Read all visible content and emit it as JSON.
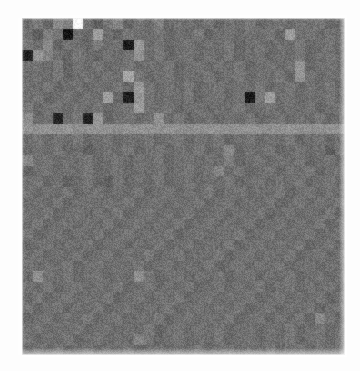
{
  "figure": {
    "background_color": "#fdfdfd",
    "caption": ""
  },
  "plot": {
    "left_px": 22,
    "top_px": 18,
    "width_px": 323,
    "height_px": 337,
    "border_color": "#e6e6e6",
    "base_color": "#6a6a6a"
  },
  "chart_data": {
    "type": "heatmap",
    "title": "",
    "subtitle": "",
    "xlabel": "",
    "ylabel": "",
    "xticklabels": [],
    "yticklabels": [],
    "legend": [],
    "grid": false,
    "colormap": "gray",
    "vmin": 0,
    "vmax": 1,
    "noise_amplitude": 0.085,
    "rows": 32,
    "cols": 32,
    "annotations": [
      {
        "label": "blank-cell",
        "row": 0,
        "col": 5,
        "value": 1.0
      },
      {
        "label": "bright-band",
        "row": 10,
        "value": 0.58
      }
    ],
    "values": [
      [
        0.42,
        0.48,
        0.4,
        0.55,
        0.5,
        1.0,
        0.44,
        0.38,
        0.46,
        0.52,
        0.4,
        0.47,
        0.43,
        0.5,
        0.41,
        0.45,
        0.44,
        0.42,
        0.47,
        0.4,
        0.45,
        0.43,
        0.48,
        0.41,
        0.44,
        0.46,
        0.42,
        0.45,
        0.43,
        0.47,
        0.41,
        0.44
      ],
      [
        0.45,
        0.38,
        0.5,
        0.47,
        0.09,
        0.44,
        0.41,
        0.62,
        0.43,
        0.4,
        0.47,
        0.44,
        0.42,
        0.46,
        0.41,
        0.45,
        0.43,
        0.48,
        0.4,
        0.44,
        0.46,
        0.42,
        0.45,
        0.43,
        0.47,
        0.41,
        0.62,
        0.44,
        0.46,
        0.42,
        0.45,
        0.43
      ],
      [
        0.47,
        0.43,
        0.55,
        0.4,
        0.46,
        0.44,
        0.41,
        0.48,
        0.42,
        0.45,
        0.11,
        0.6,
        0.43,
        0.47,
        0.41,
        0.44,
        0.46,
        0.42,
        0.45,
        0.43,
        0.47,
        0.41,
        0.44,
        0.46,
        0.42,
        0.45,
        0.43,
        0.47,
        0.41,
        0.44,
        0.46,
        0.42
      ],
      [
        0.13,
        0.58,
        0.52,
        0.44,
        0.41,
        0.47,
        0.43,
        0.4,
        0.46,
        0.42,
        0.45,
        0.57,
        0.43,
        0.47,
        0.41,
        0.44,
        0.46,
        0.42,
        0.45,
        0.43,
        0.47,
        0.41,
        0.44,
        0.46,
        0.42,
        0.45,
        0.43,
        0.47,
        0.41,
        0.44,
        0.46,
        0.42
      ],
      [
        0.44,
        0.46,
        0.42,
        0.48,
        0.4,
        0.45,
        0.43,
        0.47,
        0.41,
        0.44,
        0.46,
        0.42,
        0.45,
        0.43,
        0.47,
        0.41,
        0.44,
        0.46,
        0.42,
        0.45,
        0.43,
        0.47,
        0.41,
        0.44,
        0.46,
        0.42,
        0.45,
        0.58,
        0.41,
        0.44,
        0.46,
        0.42
      ],
      [
        0.42,
        0.45,
        0.43,
        0.47,
        0.41,
        0.44,
        0.46,
        0.42,
        0.45,
        0.43,
        0.65,
        0.47,
        0.41,
        0.44,
        0.46,
        0.42,
        0.45,
        0.43,
        0.47,
        0.41,
        0.44,
        0.46,
        0.42,
        0.45,
        0.43,
        0.47,
        0.41,
        0.58,
        0.46,
        0.42,
        0.45,
        0.43
      ],
      [
        0.45,
        0.43,
        0.47,
        0.41,
        0.44,
        0.46,
        0.42,
        0.45,
        0.43,
        0.47,
        0.41,
        0.6,
        0.46,
        0.42,
        0.45,
        0.43,
        0.47,
        0.41,
        0.44,
        0.46,
        0.42,
        0.45,
        0.43,
        0.47,
        0.41,
        0.44,
        0.46,
        0.42,
        0.45,
        0.43,
        0.47,
        0.41
      ],
      [
        0.43,
        0.47,
        0.41,
        0.44,
        0.46,
        0.42,
        0.45,
        0.43,
        0.62,
        0.41,
        0.12,
        0.58,
        0.46,
        0.42,
        0.45,
        0.43,
        0.47,
        0.41,
        0.44,
        0.46,
        0.42,
        0.45,
        0.1,
        0.47,
        0.62,
        0.44,
        0.46,
        0.42,
        0.45,
        0.43,
        0.47,
        0.41
      ],
      [
        0.47,
        0.41,
        0.44,
        0.46,
        0.42,
        0.45,
        0.43,
        0.47,
        0.41,
        0.44,
        0.46,
        0.62,
        0.45,
        0.43,
        0.47,
        0.41,
        0.44,
        0.46,
        0.42,
        0.45,
        0.43,
        0.47,
        0.41,
        0.44,
        0.46,
        0.42,
        0.45,
        0.43,
        0.47,
        0.41,
        0.44,
        0.46
      ],
      [
        0.55,
        0.42,
        0.45,
        0.14,
        0.43,
        0.47,
        0.13,
        0.58,
        0.41,
        0.44,
        0.46,
        0.42,
        0.45,
        0.58,
        0.43,
        0.47,
        0.41,
        0.44,
        0.46,
        0.42,
        0.45,
        0.43,
        0.47,
        0.41,
        0.44,
        0.46,
        0.42,
        0.45,
        0.43,
        0.47,
        0.41,
        0.44
      ],
      [
        0.58,
        0.57,
        0.58,
        0.57,
        0.58,
        0.56,
        0.57,
        0.58,
        0.57,
        0.56,
        0.57,
        0.58,
        0.57,
        0.56,
        0.58,
        0.57,
        0.56,
        0.57,
        0.58,
        0.57,
        0.56,
        0.57,
        0.58,
        0.57,
        0.56,
        0.57,
        0.58,
        0.57,
        0.56,
        0.57,
        0.58,
        0.57
      ],
      [
        0.44,
        0.46,
        0.42,
        0.45,
        0.43,
        0.47,
        0.41,
        0.44,
        0.46,
        0.42,
        0.45,
        0.43,
        0.47,
        0.41,
        0.44,
        0.46,
        0.42,
        0.45,
        0.43,
        0.47,
        0.41,
        0.44,
        0.46,
        0.42,
        0.45,
        0.43,
        0.47,
        0.41,
        0.44,
        0.46,
        0.42,
        0.45
      ],
      [
        0.42,
        0.45,
        0.43,
        0.47,
        0.41,
        0.44,
        0.38,
        0.42,
        0.45,
        0.43,
        0.47,
        0.41,
        0.44,
        0.46,
        0.42,
        0.45,
        0.43,
        0.47,
        0.41,
        0.44,
        0.53,
        0.42,
        0.45,
        0.43,
        0.47,
        0.41,
        0.44,
        0.46,
        0.42,
        0.45,
        0.38,
        0.47
      ],
      [
        0.53,
        0.44,
        0.46,
        0.42,
        0.45,
        0.43,
        0.47,
        0.41,
        0.44,
        0.46,
        0.42,
        0.45,
        0.43,
        0.47,
        0.41,
        0.44,
        0.46,
        0.42,
        0.45,
        0.43,
        0.5,
        0.41,
        0.44,
        0.46,
        0.42,
        0.45,
        0.43,
        0.47,
        0.41,
        0.44,
        0.46,
        0.42
      ],
      [
        0.4,
        0.44,
        0.46,
        0.42,
        0.45,
        0.43,
        0.47,
        0.41,
        0.44,
        0.46,
        0.42,
        0.45,
        0.43,
        0.47,
        0.41,
        0.44,
        0.46,
        0.42,
        0.45,
        0.52,
        0.43,
        0.47,
        0.41,
        0.44,
        0.46,
        0.42,
        0.45,
        0.43,
        0.47,
        0.41,
        0.44,
        0.46
      ],
      [
        0.44,
        0.46,
        0.42,
        0.45,
        0.38,
        0.43,
        0.47,
        0.41,
        0.38,
        0.46,
        0.42,
        0.45,
        0.43,
        0.47,
        0.41,
        0.44,
        0.46,
        0.42,
        0.45,
        0.43,
        0.47,
        0.41,
        0.44,
        0.46,
        0.42,
        0.45,
        0.43,
        0.47,
        0.41,
        0.44,
        0.46,
        0.42
      ],
      [
        0.46,
        0.42,
        0.45,
        0.43,
        0.47,
        0.41,
        0.44,
        0.46,
        0.42,
        0.45,
        0.43,
        0.47,
        0.41,
        0.44,
        0.46,
        0.42,
        0.45,
        0.43,
        0.47,
        0.41,
        0.44,
        0.46,
        0.42,
        0.45,
        0.43,
        0.47,
        0.41,
        0.44,
        0.46,
        0.42,
        0.45,
        0.43
      ],
      [
        0.42,
        0.45,
        0.43,
        0.47,
        0.41,
        0.44,
        0.46,
        0.42,
        0.45,
        0.43,
        0.47,
        0.41,
        0.44,
        0.46,
        0.42,
        0.45,
        0.43,
        0.47,
        0.41,
        0.44,
        0.46,
        0.42,
        0.45,
        0.43,
        0.47,
        0.41,
        0.44,
        0.46,
        0.42,
        0.45,
        0.43,
        0.47
      ],
      [
        0.45,
        0.43,
        0.47,
        0.41,
        0.44,
        0.46,
        0.42,
        0.45,
        0.43,
        0.47,
        0.41,
        0.44,
        0.46,
        0.42,
        0.45,
        0.43,
        0.47,
        0.41,
        0.44,
        0.46,
        0.42,
        0.45,
        0.43,
        0.47,
        0.41,
        0.44,
        0.46,
        0.42,
        0.45,
        0.43,
        0.47,
        0.41
      ],
      [
        0.43,
        0.47,
        0.41,
        0.44,
        0.46,
        0.42,
        0.45,
        0.43,
        0.47,
        0.41,
        0.44,
        0.46,
        0.42,
        0.45,
        0.43,
        0.47,
        0.41,
        0.44,
        0.46,
        0.42,
        0.45,
        0.43,
        0.47,
        0.41,
        0.44,
        0.46,
        0.42,
        0.45,
        0.43,
        0.47,
        0.41,
        0.44
      ],
      [
        0.47,
        0.41,
        0.44,
        0.46,
        0.42,
        0.45,
        0.43,
        0.47,
        0.41,
        0.44,
        0.46,
        0.42,
        0.45,
        0.43,
        0.47,
        0.41,
        0.44,
        0.46,
        0.42,
        0.45,
        0.43,
        0.47,
        0.41,
        0.44,
        0.46,
        0.42,
        0.45,
        0.43,
        0.47,
        0.41,
        0.44,
        0.46
      ],
      [
        0.41,
        0.44,
        0.46,
        0.42,
        0.45,
        0.43,
        0.47,
        0.41,
        0.44,
        0.46,
        0.42,
        0.45,
        0.43,
        0.47,
        0.41,
        0.44,
        0.46,
        0.42,
        0.45,
        0.43,
        0.47,
        0.41,
        0.44,
        0.46,
        0.42,
        0.45,
        0.43,
        0.47,
        0.41,
        0.44,
        0.46,
        0.42
      ],
      [
        0.44,
        0.46,
        0.42,
        0.45,
        0.43,
        0.47,
        0.41,
        0.44,
        0.46,
        0.42,
        0.45,
        0.43,
        0.47,
        0.41,
        0.44,
        0.46,
        0.42,
        0.45,
        0.43,
        0.47,
        0.41,
        0.44,
        0.46,
        0.42,
        0.45,
        0.43,
        0.47,
        0.41,
        0.44,
        0.46,
        0.42,
        0.45
      ],
      [
        0.46,
        0.42,
        0.45,
        0.43,
        0.47,
        0.41,
        0.44,
        0.46,
        0.42,
        0.45,
        0.43,
        0.47,
        0.41,
        0.44,
        0.46,
        0.42,
        0.45,
        0.43,
        0.47,
        0.41,
        0.44,
        0.46,
        0.42,
        0.45,
        0.43,
        0.47,
        0.41,
        0.44,
        0.46,
        0.42,
        0.45,
        0.43
      ],
      [
        0.42,
        0.56,
        0.45,
        0.43,
        0.47,
        0.41,
        0.44,
        0.46,
        0.42,
        0.45,
        0.43,
        0.56,
        0.47,
        0.41,
        0.44,
        0.46,
        0.42,
        0.45,
        0.43,
        0.47,
        0.41,
        0.44,
        0.46,
        0.42,
        0.45,
        0.43,
        0.47,
        0.41,
        0.44,
        0.46,
        0.42,
        0.45
      ],
      [
        0.45,
        0.43,
        0.47,
        0.41,
        0.44,
        0.46,
        0.42,
        0.45,
        0.43,
        0.47,
        0.41,
        0.44,
        0.46,
        0.42,
        0.45,
        0.43,
        0.47,
        0.41,
        0.44,
        0.46,
        0.42,
        0.45,
        0.43,
        0.47,
        0.41,
        0.44,
        0.46,
        0.42,
        0.45,
        0.43,
        0.47,
        0.41
      ],
      [
        0.43,
        0.47,
        0.41,
        0.44,
        0.46,
        0.42,
        0.45,
        0.43,
        0.47,
        0.41,
        0.44,
        0.46,
        0.42,
        0.45,
        0.43,
        0.47,
        0.41,
        0.44,
        0.46,
        0.42,
        0.45,
        0.43,
        0.47,
        0.41,
        0.44,
        0.46,
        0.42,
        0.45,
        0.43,
        0.47,
        0.41,
        0.44
      ],
      [
        0.47,
        0.41,
        0.44,
        0.46,
        0.42,
        0.45,
        0.43,
        0.47,
        0.41,
        0.44,
        0.46,
        0.42,
        0.45,
        0.43,
        0.47,
        0.41,
        0.44,
        0.46,
        0.42,
        0.45,
        0.43,
        0.47,
        0.41,
        0.44,
        0.46,
        0.42,
        0.45,
        0.43,
        0.47,
        0.41,
        0.44,
        0.46
      ],
      [
        0.41,
        0.44,
        0.46,
        0.42,
        0.45,
        0.43,
        0.47,
        0.41,
        0.44,
        0.46,
        0.42,
        0.45,
        0.43,
        0.47,
        0.41,
        0.44,
        0.46,
        0.42,
        0.45,
        0.43,
        0.47,
        0.41,
        0.44,
        0.46,
        0.42,
        0.45,
        0.43,
        0.47,
        0.41,
        0.54,
        0.46,
        0.42
      ],
      [
        0.44,
        0.46,
        0.42,
        0.45,
        0.43,
        0.47,
        0.41,
        0.44,
        0.46,
        0.42,
        0.45,
        0.43,
        0.47,
        0.41,
        0.44,
        0.46,
        0.42,
        0.45,
        0.43,
        0.47,
        0.41,
        0.44,
        0.46,
        0.42,
        0.45,
        0.43,
        0.47,
        0.41,
        0.44,
        0.46,
        0.42,
        0.45
      ],
      [
        0.46,
        0.42,
        0.45,
        0.43,
        0.47,
        0.41,
        0.44,
        0.46,
        0.42,
        0.45,
        0.43,
        0.52,
        0.47,
        0.41,
        0.44,
        0.46,
        0.42,
        0.45,
        0.43,
        0.47,
        0.41,
        0.44,
        0.46,
        0.42,
        0.45,
        0.43,
        0.47,
        0.41,
        0.44,
        0.46,
        0.42,
        0.45
      ],
      [
        0.42,
        0.45,
        0.43,
        0.47,
        0.41,
        0.44,
        0.46,
        0.42,
        0.45,
        0.43,
        0.47,
        0.41,
        0.44,
        0.46,
        0.42,
        0.45,
        0.43,
        0.47,
        0.41,
        0.44,
        0.46,
        0.42,
        0.45,
        0.43,
        0.47,
        0.41,
        0.44,
        0.46,
        0.42,
        0.45,
        0.43,
        0.47
      ]
    ]
  }
}
